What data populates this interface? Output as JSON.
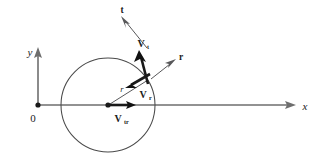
{
  "figure": {
    "type": "vector-diagram",
    "background_color": "#ffffff",
    "axis_color": "#6e6e6e",
    "circle_color": "#4a4a4a",
    "vector_color": "#1a1a1a",
    "thin_vector_color": "#58585a"
  },
  "axes": {
    "origin_label": "0",
    "x_label": "x",
    "y_label": "y",
    "x_axis": {
      "x1": 38,
      "y1": 105,
      "x2": 296,
      "y2": 105
    },
    "y_axis": {
      "x1": 38,
      "y1": 105,
      "x2": 38,
      "y2": 47
    }
  },
  "circle": {
    "center_x": 108,
    "center_y": 105,
    "radius": 47
  },
  "unit_vectors": [
    {
      "name": "t",
      "label": "t",
      "label_x": 122,
      "label_y": 12,
      "x1": 147,
      "y1": 48,
      "x2": 123,
      "y2": 20
    },
    {
      "name": "r",
      "label": "r",
      "label_x": 180,
      "label_y": 59,
      "x1": 151,
      "y1": 79,
      "x2": 174,
      "y2": 61
    }
  ],
  "velocity_vectors": [
    {
      "name": "V_t",
      "symbol": "V",
      "subscript": "t",
      "label_x": 143,
      "label_y": 47,
      "x1": 148,
      "y1": 84,
      "x2": 140,
      "y2": 52
    },
    {
      "name": "V_r",
      "symbol": "V",
      "subscript": "r",
      "label_x": 143,
      "label_y": 98,
      "x1": 150,
      "y1": 74,
      "x2": 127,
      "y2": 87
    },
    {
      "name": "V_tr",
      "symbol": "V",
      "subscript": "tr",
      "label_x": 118,
      "label_y": 122,
      "x1": 110,
      "y1": 105,
      "x2": 134,
      "y2": 105
    }
  ],
  "radius_label": {
    "text": "r",
    "label_x": 122,
    "label_y": 90,
    "line_x1": 110,
    "line_y1": 104,
    "line_x2": 148,
    "line_y2": 80
  }
}
